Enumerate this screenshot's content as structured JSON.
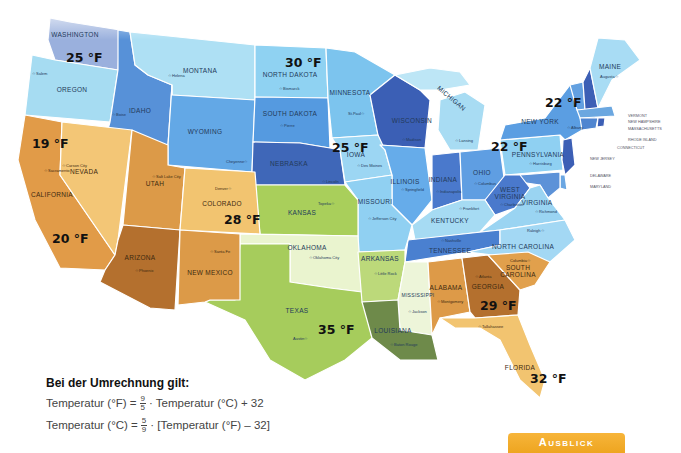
{
  "map": {
    "type": "choropleth",
    "region": "USA (contiguous states)",
    "colors": {
      "cold_dark": "#4a6fbf",
      "cold_mid": "#5d9ee0",
      "cold_light": "#8fd0f0",
      "cold_pale": "#b8e4f5",
      "green": "#a9cf5b",
      "green_pale": "#e6f2c8",
      "green_dark": "#6e8a4a",
      "warm_dark": "#b8732f",
      "warm_mid": "#dd9a45",
      "warm_light": "#f2c46e"
    },
    "states": [
      {
        "name": "WASHINGTON",
        "capital": "Olympia"
      },
      {
        "name": "OREGON",
        "capital": "Salem"
      },
      {
        "name": "IDAHO",
        "capital": "Boise"
      },
      {
        "name": "MONTANA",
        "capital": "Helena"
      },
      {
        "name": "WYOMING",
        "capital": "Cheyenne"
      },
      {
        "name": "NORTH DAKOTA",
        "capital": "Bismarck"
      },
      {
        "name": "SOUTH DAKOTA",
        "capital": "Pierre"
      },
      {
        "name": "MINNESOTA",
        "capital": "St.Paul"
      },
      {
        "name": "WISCONSIN",
        "capital": "Madison"
      },
      {
        "name": "MICHIGAN",
        "capital": "Lansing"
      },
      {
        "name": "NEBRASKA",
        "capital": "Lincoln"
      },
      {
        "name": "IOWA",
        "capital": "Des Moines"
      },
      {
        "name": "ILLINOIS",
        "capital": "Springfield"
      },
      {
        "name": "INDIANA",
        "capital": "Indianapolis"
      },
      {
        "name": "OHIO",
        "capital": "Columbus"
      },
      {
        "name": "PENNSYLVANIA",
        "capital": "Harrisburg"
      },
      {
        "name": "NEW YORK",
        "capital": "Albany"
      },
      {
        "name": "MAINE",
        "capital": "Augusta"
      },
      {
        "name": "VERMONT",
        "capital": "Montpelier"
      },
      {
        "name": "NEW HAMPSHIRE",
        "capital": "Concord"
      },
      {
        "name": "MASSACHUSETTS",
        "capital": "Boston"
      },
      {
        "name": "RHODE ISLAND",
        "capital": "Providence"
      },
      {
        "name": "CONNECTICUT",
        "capital": "Hartford"
      },
      {
        "name": "NEW JERSEY",
        "capital": "Trenton"
      },
      {
        "name": "DELAWARE",
        "capital": "Dover"
      },
      {
        "name": "MARYLAND",
        "capital": "Annapolis"
      },
      {
        "name": "WEST VIRGINIA",
        "capital": "Charleston"
      },
      {
        "name": "VIRGINIA",
        "capital": "Richmond"
      },
      {
        "name": "KENTUCKY",
        "capital": "Frankfort"
      },
      {
        "name": "TENNESSEE",
        "capital": "Nashville"
      },
      {
        "name": "NORTH CAROLINA",
        "capital": "Raleigh"
      },
      {
        "name": "SOUTH CAROLINA",
        "capital": "Columbia"
      },
      {
        "name": "GEORGIA",
        "capital": "Atlanta"
      },
      {
        "name": "FLORIDA",
        "capital": "Tallahassee"
      },
      {
        "name": "ALABAMA",
        "capital": "Montgomery"
      },
      {
        "name": "MISSISSIPPI",
        "capital": "Jackson"
      },
      {
        "name": "LOUISIANA",
        "capital": "Baton Rouge"
      },
      {
        "name": "ARKANSAS",
        "capital": "Little Rock"
      },
      {
        "name": "MISSOURI",
        "capital": "Jefferson City"
      },
      {
        "name": "KANSAS",
        "capital": "Topeka"
      },
      {
        "name": "OKLAHOMA",
        "capital": "Oklahoma City"
      },
      {
        "name": "TEXAS",
        "capital": "Austin"
      },
      {
        "name": "NEW MEXICO",
        "capital": "Santa Fe"
      },
      {
        "name": "COLORADO",
        "capital": "Denver"
      },
      {
        "name": "UTAH",
        "capital": "Salt Lake City"
      },
      {
        "name": "ARIZONA",
        "capital": "Phoenix"
      },
      {
        "name": "NEVADA",
        "capital": "Carson City"
      },
      {
        "name": "CALIFORNIA",
        "capital": "Sacramento"
      }
    ],
    "temperatures": [
      {
        "state": "WASHINGTON",
        "label": "25 °F"
      },
      {
        "state": "NORTH DAKOTA",
        "label": "30 °F"
      },
      {
        "state": "NEW YORK",
        "label": "22 °F"
      },
      {
        "state": "CALIFORNIA (north)",
        "label": "19 °F"
      },
      {
        "state": "IOWA",
        "label": "25 °F"
      },
      {
        "state": "PENNSYLVANIA/OHIO",
        "label": "22 °F"
      },
      {
        "state": "COLORADO",
        "label": "28 °F"
      },
      {
        "state": "CALIFORNIA (south)",
        "label": "20 °F"
      },
      {
        "state": "TEXAS",
        "label": "35 °F"
      },
      {
        "state": "GEORGIA",
        "label": "29 °F"
      },
      {
        "state": "FLORIDA",
        "label": "32 °F"
      }
    ]
  },
  "formula": {
    "title": "Bei der Umrechnung gilt:",
    "line1_left": "Temperatur (°F) =",
    "line1_num": "9",
    "line1_den": "5",
    "line1_right": "· Temperatur (°C) + 32",
    "line2_left": "Temperatur (°C) =",
    "line2_num": "5",
    "line2_den": "9",
    "line2_right": "· [Temperatur (°F) – 32]"
  },
  "tab": {
    "label": "Ausblick",
    "color": "#f2ac2c"
  }
}
